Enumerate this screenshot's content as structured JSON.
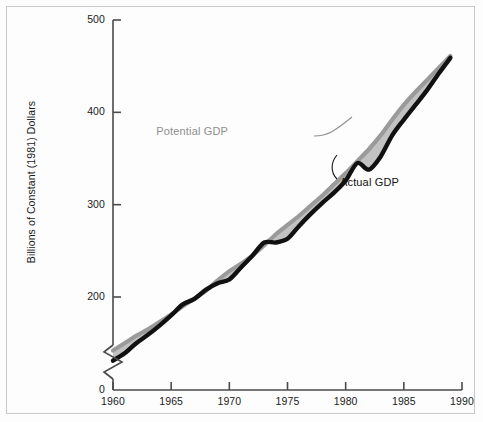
{
  "figure": {
    "background_color": "#fdfdfd",
    "border_color": "#c9c9c9"
  },
  "chart_data": {
    "type": "line",
    "title": "",
    "subtitle": "",
    "xlabel": "",
    "ylabel": "Billions of Constant (1981) Dollars",
    "xlim": [
      1959,
      1990
    ],
    "ylim": [
      0,
      500
    ],
    "y_axis_break": true,
    "y_axis_break_note": "axis broken between 0 and ~120",
    "grid": false,
    "legend_position": "inline-annotation",
    "x_ticks": [
      1960,
      1965,
      1970,
      1975,
      1980,
      1985,
      1990
    ],
    "x_tick_labels": [
      "1960",
      "1965",
      "1970",
      "1975",
      "1980",
      "1985",
      "1990"
    ],
    "y_ticks": [
      0,
      200,
      300,
      400,
      500
    ],
    "y_tick_labels": [
      "0",
      "200",
      "300",
      "400",
      "500"
    ],
    "x": [
      1960,
      1961,
      1962,
      1963,
      1964,
      1965,
      1966,
      1967,
      1968,
      1969,
      1970,
      1971,
      1972,
      1973,
      1974,
      1975,
      1976,
      1977,
      1978,
      1979,
      1980,
      1981,
      1982,
      1983,
      1984,
      1985,
      1986,
      1987,
      1988,
      1989
    ],
    "series": [
      {
        "name": "Potential GDP",
        "color": "#9a9a9a",
        "label_color": "#8f8f8f",
        "values": [
          142,
          150,
          158,
          165,
          173,
          181,
          190,
          198,
          207,
          218,
          228,
          236,
          245,
          256,
          268,
          278,
          288,
          299,
          310,
          322,
          334,
          347,
          360,
          375,
          392,
          408,
          422,
          435,
          448,
          461
        ]
      },
      {
        "name": "Actual GDP",
        "color": "#111111",
        "label_color": "#121212",
        "values": [
          131,
          139,
          150,
          159,
          169,
          180,
          192,
          198,
          208,
          215,
          219,
          232,
          245,
          259,
          259,
          263,
          277,
          290,
          302,
          313,
          326,
          345,
          338,
          352,
          375,
          392,
          408,
          424,
          442,
          459
        ]
      }
    ],
    "gap_fill": {
      "name": "output-gap-shading",
      "color": "#c2c2c2",
      "description": "shaded area between Potential GDP and Actual GDP"
    },
    "annotations": [
      {
        "name": "potential-gdp-annotation",
        "text": "Potential GDP",
        "x_px": 228,
        "y_px": 131
      },
      {
        "name": "actual-gdp-annotation",
        "text": "Actual GDP",
        "x_px": 340,
        "y_px": 182
      }
    ]
  }
}
